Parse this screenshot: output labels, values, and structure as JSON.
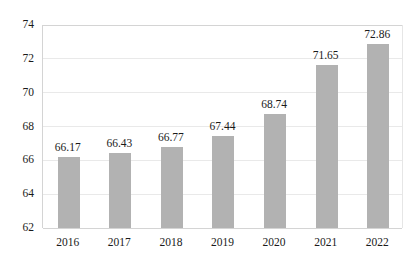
{
  "chart_data": {
    "type": "bar",
    "title": "",
    "subtitle": "",
    "xlabel": "",
    "ylabel": "",
    "categories": [
      "2016",
      "2017",
      "2018",
      "2019",
      "2020",
      "2021",
      "2022"
    ],
    "values": [
      66.17,
      66.43,
      66.77,
      67.44,
      68.74,
      71.65,
      72.86
    ],
    "value_labels": [
      "66.17",
      "66.43",
      "66.77",
      "67.44",
      "68.74",
      "71.65",
      "72.86"
    ],
    "ylim": [
      62,
      74
    ],
    "ytick_labels": [
      "62",
      "64",
      "66",
      "68",
      "70",
      "72",
      "74"
    ],
    "ytick_values": [
      62,
      64,
      66,
      68,
      70,
      72,
      74
    ],
    "grid": true,
    "legend": null,
    "legend_position": "none",
    "bar_color": "#b2b2b2",
    "grid_color": "#e9e9e9",
    "axis_color": "#d4d4d4",
    "background_color": "#ffffff",
    "text_color": "#1a1a1a"
  }
}
